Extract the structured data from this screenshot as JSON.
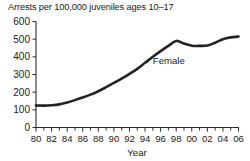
{
  "chart_data": {
    "type": "line",
    "title": "Arrests per 100,000 juveniles ages 10–17",
    "xlabel": "Year",
    "ylabel": "",
    "xlim": [
      1980,
      2006
    ],
    "ylim": [
      0,
      600
    ],
    "grid": false,
    "legend_position": "inline-annotation",
    "y_ticks": [
      0,
      100,
      200,
      300,
      400,
      500,
      600
    ],
    "y_tick_labels": [
      "0",
      "100",
      "200",
      "300",
      "400",
      "500",
      "600"
    ],
    "x_ticks": [
      1980,
      1982,
      1984,
      1986,
      1988,
      1990,
      1992,
      1994,
      1996,
      1998,
      2000,
      2002,
      2004,
      2006
    ],
    "x_tick_labels": [
      "80",
      "82",
      "84",
      "86",
      "88",
      "90",
      "92",
      "94",
      "96",
      "98",
      "00",
      "02",
      "04",
      "06"
    ],
    "x_minor_tick_interval": 1,
    "line_color": "#232323",
    "annotations": [
      {
        "text": "Female",
        "x": 1995.0,
        "y": 360
      }
    ],
    "series": [
      {
        "name": "Female",
        "x": [
          1980,
          1981,
          1982,
          1983,
          1984,
          1985,
          1986,
          1987,
          1988,
          1989,
          1990,
          1991,
          1992,
          1993,
          1994,
          1995,
          1996,
          1997,
          1998,
          1999,
          2000,
          2001,
          2002,
          2003,
          2004,
          2005,
          2006
        ],
        "values": [
          125,
          124,
          126,
          131,
          142,
          155,
          170,
          186,
          205,
          228,
          252,
          277,
          303,
          332,
          366,
          400,
          432,
          462,
          490,
          475,
          463,
          462,
          464,
          480,
          500,
          510,
          515
        ]
      }
    ]
  }
}
